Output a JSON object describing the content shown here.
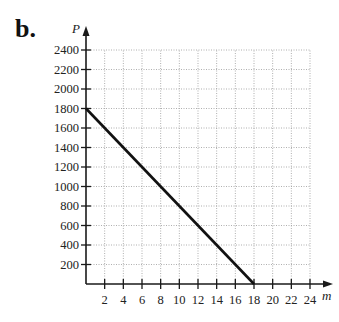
{
  "header": {
    "panel_label": "b."
  },
  "chart_data": {
    "type": "line",
    "title": "",
    "xlabel": "m",
    "ylabel": "P",
    "xlim": [
      0,
      24
    ],
    "ylim": [
      0,
      2400
    ],
    "x_ticks": [
      2,
      4,
      6,
      8,
      10,
      12,
      14,
      16,
      18,
      20,
      22,
      24
    ],
    "y_ticks": [
      200,
      400,
      600,
      800,
      1000,
      1200,
      1400,
      1600,
      1800,
      2000,
      2200,
      2400
    ],
    "grid": true,
    "grid_style": "dotted",
    "legend": null,
    "series": [
      {
        "name": "P",
        "x": [
          0,
          18
        ],
        "y": [
          1800,
          0
        ],
        "color": "#111111"
      }
    ]
  },
  "colors": {
    "axis": "#1a1a1a",
    "grid": "#9a9a9a",
    "line": "#111111"
  }
}
